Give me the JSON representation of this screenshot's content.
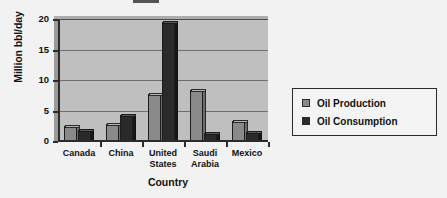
{
  "chart_data": {
    "type": "bar",
    "title": "",
    "xlabel": "Country",
    "ylabel": "Million bbl/day",
    "categories": [
      "Canada",
      "China",
      "United States",
      "Saudi Arabia",
      "Mexico"
    ],
    "category_label_lines": [
      [
        "Canada"
      ],
      [
        "China"
      ],
      [
        "United",
        "States"
      ],
      [
        "Saudi",
        "Arabia"
      ],
      [
        "Mexico"
      ]
    ],
    "series": [
      {
        "name": "Oil Production",
        "color": "#8a8a8a",
        "values": [
          2.7,
          3.0,
          7.8,
          8.5,
          3.4
        ]
      },
      {
        "name": "Oil Consumption",
        "color": "#2a2a2a",
        "values": [
          1.9,
          4.5,
          19.7,
          1.4,
          1.7
        ]
      }
    ],
    "ylim": [
      0,
      20
    ],
    "yticks": [
      0,
      5,
      10,
      15,
      20
    ],
    "ytick_labels": [
      "0",
      "5",
      "10",
      "15",
      "20"
    ],
    "grid": true,
    "grid_axis": "y",
    "legend_position": "right",
    "plot_background": "#bfbfbf",
    "figure_background": "#f2f2f2"
  },
  "legend": {
    "entries": [
      {
        "label": "Oil Production",
        "swatch": "#8a8a8a"
      },
      {
        "label": "Oil Consumption",
        "swatch": "#2a2a2a"
      }
    ]
  },
  "axes": {
    "y_title": "Million bbl/day",
    "x_title": "Country"
  }
}
